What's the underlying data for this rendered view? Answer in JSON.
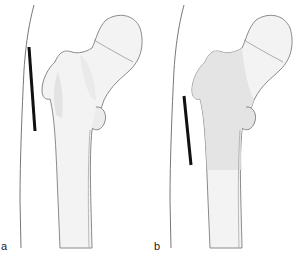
{
  "figure": {
    "panels": [
      {
        "label": "a",
        "shading": "greater trochanter region lightly shaded",
        "marker": "black bar lateral to trochanter (higher position)"
      },
      {
        "label": "b",
        "shading": "proximal shaft and trochanter shaded",
        "marker": "black bar lateral to proximal shaft (lower position)"
      }
    ]
  },
  "colors": {
    "bone_fill": "#f3f3f3",
    "bone_outline": "#8a8a8a",
    "shade": "#e2e2e2",
    "marker": "#111111",
    "skin_line": "#777777"
  }
}
